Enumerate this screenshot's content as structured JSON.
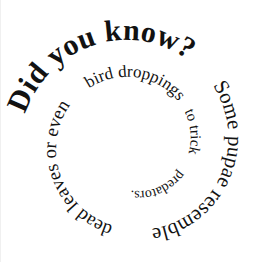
{
  "canvas": {
    "width": 265,
    "height": 262,
    "background_color": "#ffffff",
    "text_color": "#121212"
  },
  "spiral_text": {
    "full_text": "Did you know? Some pupae resemble dead leaves or even bird droppings to trick predators.",
    "heading": "Did you know?",
    "body": "Some pupae resemble dead leaves or even bird droppings to trick predators.",
    "direction": "inward-clockwise",
    "start_position": "upper-left",
    "segments": [
      {
        "id": "seg-heading",
        "text": "Did you know?",
        "weight": "bold",
        "font_size": 30,
        "start_angle": 196,
        "sweep": 128,
        "start_radius": 119,
        "end_radius": 105,
        "letter_spacing": 1.5
      },
      {
        "id": "seg-some-pupae-resemble",
        "text": "Some pupae resemble",
        "weight": "regular",
        "font_size": 21,
        "start_angle": 324,
        "sweep": 140,
        "start_radius": 104,
        "end_radius": 89,
        "letter_spacing": 0.6
      },
      {
        "id": "seg-dead-leaves-or-even",
        "text": "dead leaves or even",
        "weight": "regular",
        "font_size": 19,
        "start_angle": 104,
        "sweep": 128,
        "start_radius": 88,
        "end_radius": 76,
        "letter_spacing": 0.4
      },
      {
        "id": "seg-bird-droppings",
        "text": "bird droppings",
        "weight": "regular",
        "font_size": 17,
        "start_angle": 232,
        "sweep": 96,
        "start_radius": 75,
        "end_radius": 65,
        "letter_spacing": 0.4
      },
      {
        "id": "seg-to-trick",
        "text": "to trick",
        "weight": "regular",
        "font_size": 15,
        "start_angle": 328,
        "sweep": 62,
        "start_radius": 64,
        "end_radius": 57,
        "letter_spacing": 0.3
      },
      {
        "id": "seg-predators",
        "text": "predators.",
        "weight": "regular",
        "font_size": 14,
        "start_angle": 30,
        "sweep": 86,
        "start_radius": 56,
        "end_radius": 47,
        "letter_spacing": 0.3
      }
    ],
    "center": {
      "x": 133,
      "y": 144
    }
  }
}
